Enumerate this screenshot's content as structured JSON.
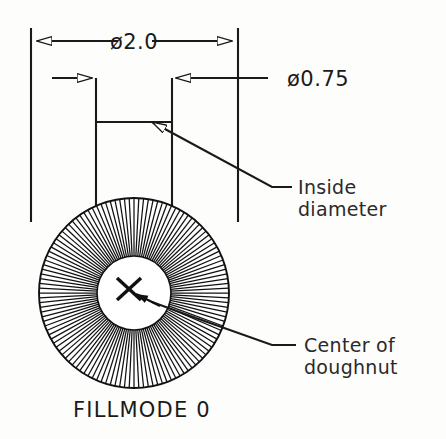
{
  "drawing": {
    "title_label": "FILLMODE 0",
    "dimensions": [
      {
        "name": "outside-diameter",
        "text": "ø2.0",
        "value": 2.0,
        "symbol": "ø",
        "line_y": 41,
        "x_start": 31,
        "x_end": 238,
        "arrow_style": "hollow",
        "text_x": 134,
        "text_y": 48
      },
      {
        "name": "inside-diameter",
        "text": "ø0.75",
        "value": 0.75,
        "symbol": "ø",
        "line_y": 78,
        "x_start": 96,
        "x_end": 172,
        "arrow_style": "hollow",
        "text_x": 290,
        "text_y": 86
      }
    ],
    "leaders": [
      {
        "name": "inside-diameter-leader",
        "line1": "Inside",
        "line2": "diameter",
        "text_x": 298,
        "text_y1": 194,
        "text_y2": 216,
        "arrow_x": 144,
        "arrow_y": 122,
        "elbow_x": 272,
        "elbow_y": 187,
        "tail_x": 292,
        "tail_y": 187
      },
      {
        "name": "center-of-doughnut-leader",
        "line1": "Center  of",
        "line2": "doughnut",
        "text_x": 304,
        "text_y1": 352,
        "text_y2": 374,
        "arrow_x": 147,
        "arrow_y": 300,
        "elbow_x": 272,
        "elbow_y": 345,
        "tail_x": 296,
        "tail_y": 345
      }
    ],
    "doughnut": {
      "name": "doughnut-shape",
      "center_x": 134,
      "center_y": 293,
      "outer_radius": 95,
      "inner_radius": 37,
      "spoke_count": 124,
      "fill_mode": 0,
      "stroke_color": "#111111",
      "fill_color": "#ffffff"
    },
    "center_marker": {
      "name": "center-cross-marker",
      "x": 128,
      "y": 288,
      "size": 13
    },
    "extension_lines": [
      {
        "name": "ext-left-outer",
        "x": 31,
        "y_top": 28,
        "y_bottom": 222
      },
      {
        "name": "ext-right-outer",
        "x": 238,
        "y_top": 28,
        "y_bottom": 222
      },
      {
        "name": "ext-left-inner",
        "x": 96,
        "y_top": 78,
        "y_bottom": 270
      },
      {
        "name": "ext-right-inner",
        "x": 172,
        "y_top": 78,
        "y_bottom": 270
      },
      {
        "name": "ext-inner-tie",
        "x": 96,
        "y_top": 122,
        "y_bottom": 122
      }
    ],
    "colors": {
      "ink": "#1a1a1a",
      "paper": "#fdfdfc",
      "hatch": "#111111"
    }
  }
}
